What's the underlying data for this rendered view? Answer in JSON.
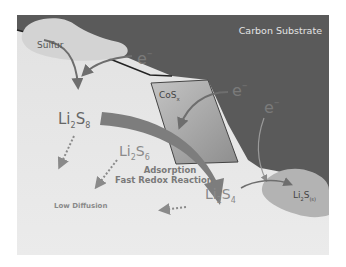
{
  "diagram": {
    "substrate_label": "Carbon Substrate",
    "sulfur_label": "Sulfur",
    "catalyst_label": {
      "main": "CoS",
      "sub": "x"
    },
    "electron_symbol": "e",
    "electron_charge": "−",
    "species": [
      {
        "id": "li2s8",
        "li": "Li",
        "n1": "2",
        "s": "S",
        "n2": "8"
      },
      {
        "id": "li2s6",
        "li": "Li",
        "n1": "2",
        "s": "S",
        "n2": "6"
      },
      {
        "id": "li2s4",
        "li": "Li",
        "n1": "2",
        "s": "S",
        "n2": "4"
      },
      {
        "id": "li2s",
        "li": "Li",
        "n1": "2",
        "s": "S",
        "n2": "(s)"
      }
    ],
    "annotations": {
      "adsorption_line1": "Adsorption",
      "adsorption_line2": "Fast Redox Reaction",
      "low_diffusion": "Low Diffusion"
    },
    "colors": {
      "substrate": "#5a5a5a",
      "background": "#e6e6e6",
      "sulfur_blob": "#d2d2d2",
      "catalyst": "#a9a9a9",
      "big_arrow": "#7d7d7d",
      "arrow": "#6e6e6e",
      "species_text": "#8a8a8a",
      "label_dark": "#6a6a6a",
      "substrate_text": "#e4e4e4"
    }
  }
}
